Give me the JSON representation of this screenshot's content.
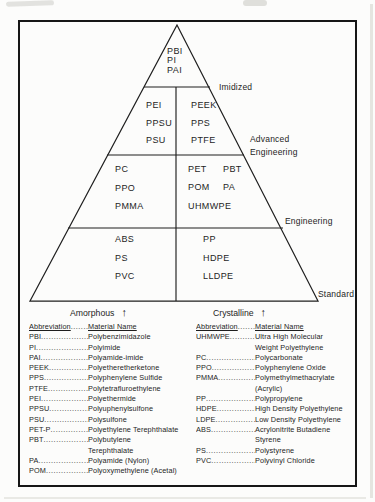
{
  "pyramid": {
    "tier1": {
      "materials": [
        "PBI",
        "PI",
        "PAI"
      ]
    },
    "tier2": {
      "left": [
        "PEI",
        "PPSU",
        "PSU"
      ],
      "right": [
        "PEEK",
        "PPS",
        "PTFE"
      ]
    },
    "tier3": {
      "left": [
        "PC",
        "PPO",
        "PMMA"
      ],
      "right": [
        "PET",
        "PBT",
        "POM",
        "PA",
        "UHMWPE"
      ]
    },
    "tier4": {
      "left": [
        "ABS",
        "PS",
        "PVC"
      ],
      "right": [
        "PP",
        "HDPE",
        "LLDPE"
      ]
    },
    "levels": {
      "tier1": "Imidized",
      "tier2_line1": "Advanced",
      "tier2_line2": "Engineering",
      "tier3": "Engineering",
      "tier4": "Standard"
    },
    "axes": {
      "left": "Amorphous",
      "right": "Crystalline",
      "arrow_glyph": "↑"
    },
    "line_color": "#1f1f1f"
  },
  "legend": {
    "header_abbr": "Abbreviation",
    "header_name": "Material Name",
    "left_rows": [
      {
        "abbr": "PBI",
        "name": "Polybenzimidazole"
      },
      {
        "abbr": "PI",
        "name": "Polyimide"
      },
      {
        "abbr": "PAI",
        "name": "Polyamide-imide"
      },
      {
        "abbr": "PEEK",
        "name": "Polyetheretherketone"
      },
      {
        "abbr": "PPS",
        "name": "Polyphenylene Sulfide"
      },
      {
        "abbr": "PTFE",
        "name": "Polytetrafluroethylene"
      },
      {
        "abbr": "PEI",
        "name": "Polyethermide"
      },
      {
        "abbr": "PPSU",
        "name": "Polyuphenylsulfone"
      },
      {
        "abbr": "PSU",
        "name": "Polysulfone"
      },
      {
        "abbr": "PET-P",
        "name": "Polyethylene Terephthalate"
      },
      {
        "abbr": "PBT",
        "name": "Polybutylene\nTerephthalate"
      },
      {
        "abbr": "PA",
        "name": "Polyamide (Nylon)"
      },
      {
        "abbr": "POM",
        "name": "Polyoxymethylene (Acetal)"
      }
    ],
    "right_rows": [
      {
        "abbr": "UHMWPE",
        "name": "Ultra High Molecular\nWeight Polyethylene"
      },
      {
        "abbr": "PC",
        "name": "Polycarbonate"
      },
      {
        "abbr": "PPO",
        "name": "Polyphenylene Oxide"
      },
      {
        "abbr": "PMMA",
        "name": "Polymethylmethacrylate\n(Acrylic)"
      },
      {
        "abbr": "PP",
        "name": "Polypropylene"
      },
      {
        "abbr": "HDPE",
        "name": "High Density Polyethylene"
      },
      {
        "abbr": "LDPE",
        "name": "Low Density Polyethylene"
      },
      {
        "abbr": "ABS",
        "name": "Acrylonitrite Butadiene\nStyrene"
      },
      {
        "abbr": "PS",
        "name": "Polystyrene"
      },
      {
        "abbr": "PVC",
        "name": "Polyvinyl Chloride"
      }
    ]
  }
}
